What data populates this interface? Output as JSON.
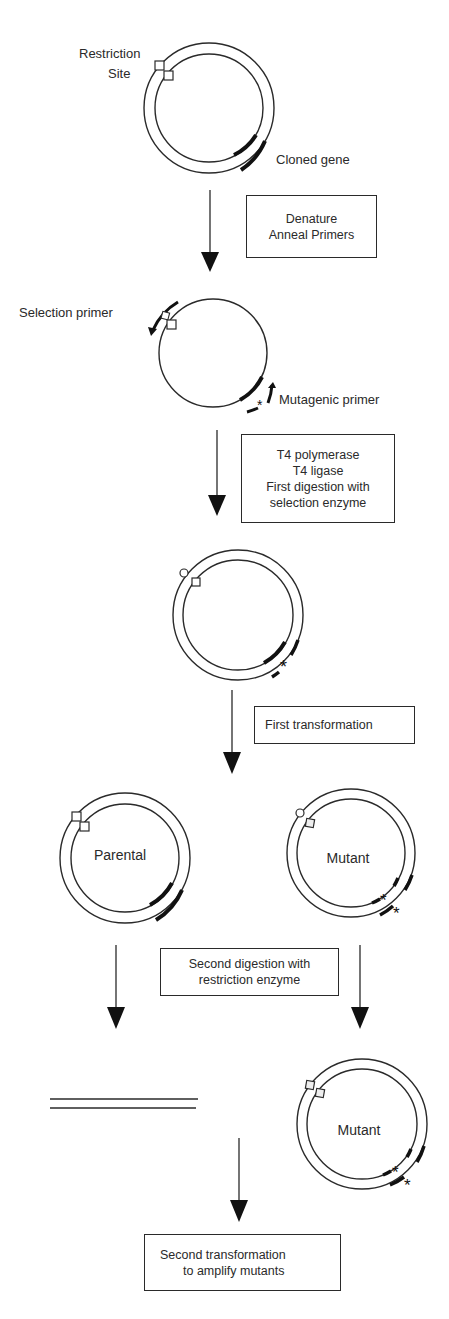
{
  "labels": {
    "restriction_site_line1": "Restriction",
    "restriction_site_line2": "Site",
    "cloned_gene": "Cloned gene",
    "selection_primer": "Selection primer",
    "mutagenic_primer": "Mutagenic primer",
    "parental": "Parental",
    "mutant_1": "Mutant",
    "mutant_2": "Mutant"
  },
  "steps": [
    {
      "id": "step1",
      "lines": [
        "Denature",
        "Anneal Primers"
      ]
    },
    {
      "id": "step2",
      "lines": [
        "T4 polymerase",
        "T4 ligase",
        "First  digestion with",
        "selection enzyme"
      ]
    },
    {
      "id": "step3",
      "lines": [
        "First transformation"
      ]
    },
    {
      "id": "step4",
      "lines": [
        "Second digestion with",
        "restriction enzyme"
      ]
    },
    {
      "id": "step5",
      "lines": [
        "Second transformation",
        "to amplify mutants"
      ]
    }
  ],
  "symbols": {
    "mutation_marker": "*"
  },
  "colors": {
    "line": "#2a2a2a",
    "background": "#ffffff"
  }
}
